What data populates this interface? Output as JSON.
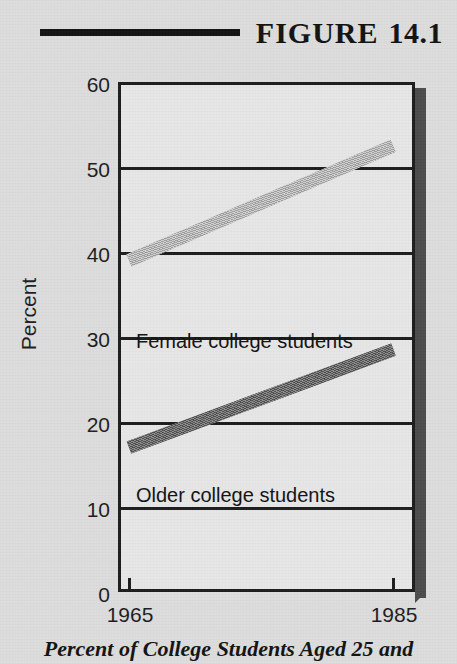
{
  "header": {
    "rule_icon": "horizontal-rule",
    "figure_word": "FIGURE",
    "figure_number": "14.1",
    "full_title": "FIGURE 14.1"
  },
  "caption": {
    "text": "Percent of College Students Aged 25 and"
  },
  "colors": {
    "page_background": "#dcdcdc",
    "plot_background": "#e6e6e6",
    "axis": "#1b1b1b",
    "shadow": "#4a4a4a",
    "series_female": "#b4b4b4",
    "series_older": "#676767",
    "text": "#111111"
  },
  "chart_data": {
    "type": "line",
    "subtitle": "Percent of College Students Aged 25 and",
    "xlabel": "",
    "ylabel": "Percent",
    "x": [
      1965,
      1985
    ],
    "xtick_labels": [
      "1965",
      "1985"
    ],
    "xlim": [
      1963,
      1986
    ],
    "ylim": [
      0,
      60
    ],
    "ytick_labels": [
      "0",
      "10",
      "20",
      "30",
      "40",
      "50",
      "60"
    ],
    "yticks": [
      0,
      10,
      20,
      30,
      40,
      50,
      60
    ],
    "grid": true,
    "grid_axis": "y",
    "legend": "inline-annotations",
    "series": [
      {
        "name": "Female college students",
        "values": [
          39,
          52.5
        ],
        "color": "#b4b4b4",
        "label_text": "Female college students"
      },
      {
        "name": "Older college students",
        "values": [
          17,
          28.5
        ],
        "color": "#676767",
        "label_text": "Older college students"
      }
    ]
  }
}
